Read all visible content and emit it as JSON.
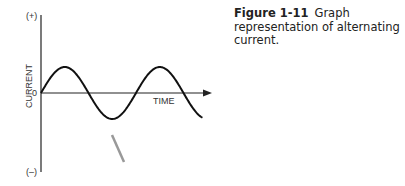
{
  "figure": {
    "number_label": "Figure 1-11",
    "caption": "Graph representation of alternating current."
  },
  "chart_data": {
    "type": "line",
    "title": "",
    "xlabel": "TIME",
    "ylabel": "CURRENT",
    "y_top_label": "(+)",
    "y_bottom_label": "(–)",
    "origin_label": "0",
    "function": "sine",
    "cycles_shown": 1.7,
    "amplitude": 1,
    "ylim": [
      -3,
      3
    ],
    "grid": false,
    "legend": "none"
  }
}
